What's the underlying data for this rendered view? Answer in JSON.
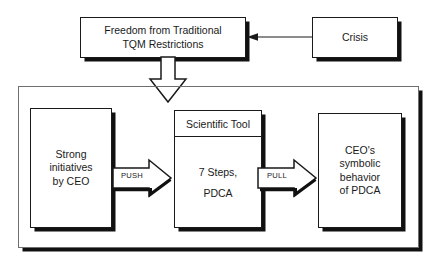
{
  "diagram": {
    "background_color": "#ffffff",
    "line_color": "#1a1a1a",
    "frame_color": "#6f6f6f",
    "shadow_color": "#111111"
  },
  "top_row": {
    "freedom_box": {
      "label": "Freedom from Traditional\nTQM Restrictions"
    },
    "crisis_box": {
      "label": "Crisis"
    },
    "crisis_arrow": {
      "icon": "arrow-left-icon",
      "direction": "left",
      "from": "Crisis",
      "to": "Freedom from Traditional TQM Restrictions"
    },
    "down_arrow": {
      "icon": "arrow-down-hollow-icon",
      "direction": "down",
      "from": "Freedom from Traditional TQM Restrictions",
      "to": "process frame"
    }
  },
  "process_frame": {
    "left_box": {
      "label": "Strong\ninitiatives\nby CEO"
    },
    "middle_box": {
      "header": "Scientific Tool",
      "body": "7 Steps,\nPDCA"
    },
    "right_box": {
      "label": "CEO's\nsymbolic\nbehavior\nof PDCA"
    },
    "push_arrow": {
      "label": "PUSH",
      "icon": "arrow-right-block-icon",
      "direction": "right"
    },
    "pull_arrow": {
      "label": "PULL",
      "icon": "arrow-right-block-icon",
      "direction": "right"
    }
  }
}
